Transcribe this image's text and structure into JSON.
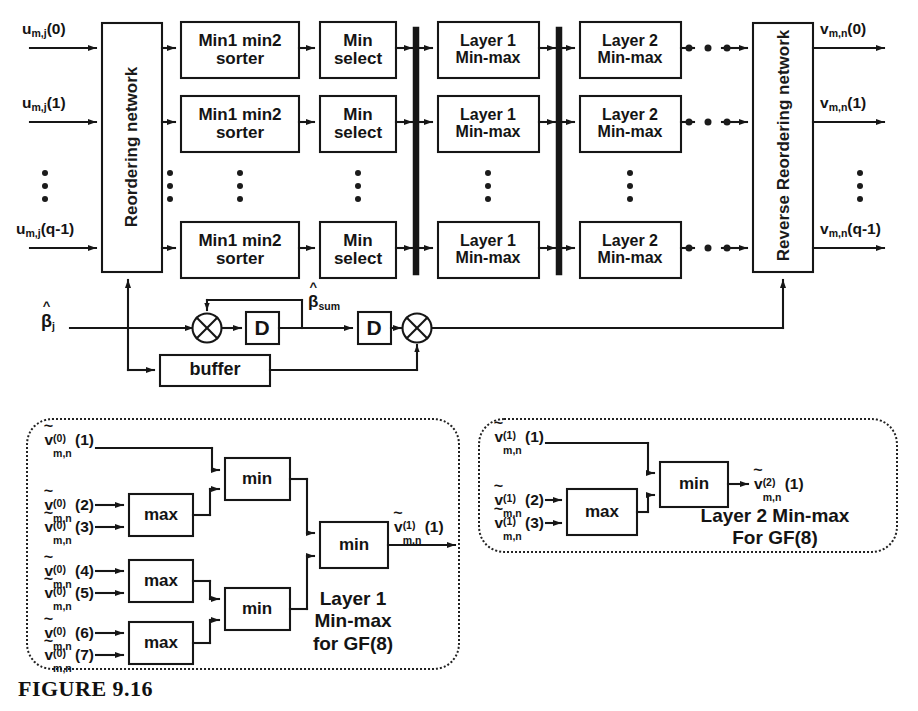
{
  "figure": {
    "caption": "FIGURE 9.16",
    "ink_color": "#141414",
    "background": "#ffffff"
  },
  "top_diagram": {
    "inputs": [
      {
        "base": "u",
        "sub": "m,j",
        "arg": "(0)"
      },
      {
        "base": "u",
        "sub": "m,j",
        "arg": "(1)"
      },
      {
        "base": "u",
        "sub": "m,j",
        "arg": "(q-1)"
      }
    ],
    "outputs": [
      {
        "base": "v",
        "sub": "m,n",
        "arg": "(0)"
      },
      {
        "base": "v",
        "sub": "m,n",
        "arg": "(1)"
      },
      {
        "base": "v",
        "sub": "m,n",
        "arg": "(q-1)"
      }
    ],
    "reordering_network_label": "Reordering network",
    "reverse_reordering_network_label": "Reverse Reordering network",
    "stages": [
      {
        "id": "sorter",
        "line1": "Min1 min2",
        "line2": "sorter"
      },
      {
        "id": "min-select",
        "line1": "Min",
        "line2": "select"
      },
      {
        "id": "layer1",
        "line1": "Layer 1",
        "line2": "Min-max"
      },
      {
        "id": "layer2",
        "line1": "Layer 2",
        "line2": "Min-max"
      }
    ],
    "control_path": {
      "beta_in": {
        "base": "β",
        "sub": "j",
        "hat": true
      },
      "beta_sum": {
        "base": "β",
        "sub": "sum",
        "hat": true
      },
      "delay_label": "D",
      "delay_count": 2,
      "adder_symbol": "⊕",
      "adder_count": 2,
      "buffer_label": "buffer"
    }
  },
  "layer1_block": {
    "title_lines": [
      "Layer 1",
      "Min-max",
      "for GF(8)"
    ],
    "inputs": [
      {
        "base": "v",
        "sup": "(0)",
        "sub": "m,n",
        "arg": "(1)"
      },
      {
        "base": "v",
        "sup": "(0)",
        "sub": "m,n",
        "arg": "(2)"
      },
      {
        "base": "v",
        "sup": "(0)",
        "sub": "m,n",
        "arg": "(3)"
      },
      {
        "base": "v",
        "sup": "(0)",
        "sub": "m,n",
        "arg": "(4)"
      },
      {
        "base": "v",
        "sup": "(0)",
        "sub": "m,n",
        "arg": "(5)"
      },
      {
        "base": "v",
        "sup": "(0)",
        "sub": "m,n",
        "arg": "(6)"
      },
      {
        "base": "v",
        "sup": "(0)",
        "sub": "m,n",
        "arg": "(7)"
      }
    ],
    "output": {
      "base": "v",
      "sup": "(1)",
      "sub": "m,n",
      "arg": "(1)"
    },
    "gates": [
      {
        "id": "max-1",
        "label": "max"
      },
      {
        "id": "max-2",
        "label": "max"
      },
      {
        "id": "max-3",
        "label": "max"
      },
      {
        "id": "min-top",
        "label": "min"
      },
      {
        "id": "min-bottom",
        "label": "min"
      },
      {
        "id": "min-final",
        "label": "min"
      }
    ]
  },
  "layer2_block": {
    "title_lines": [
      "Layer 2 Min-max",
      "For GF(8)"
    ],
    "inputs": [
      {
        "base": "v",
        "sup": "(1)",
        "sub": "m,n",
        "arg": "(1)"
      },
      {
        "base": "v",
        "sup": "(1)",
        "sub": "m,n",
        "arg": "(2)"
      },
      {
        "base": "v",
        "sup": "(1)",
        "sub": "m,n",
        "arg": "(3)"
      }
    ],
    "output": {
      "base": "v",
      "sup": "(2)",
      "sub": "m,n",
      "arg": "(1)"
    },
    "gates": [
      {
        "id": "max-1",
        "label": "max"
      },
      {
        "id": "min-1",
        "label": "min"
      }
    ]
  }
}
